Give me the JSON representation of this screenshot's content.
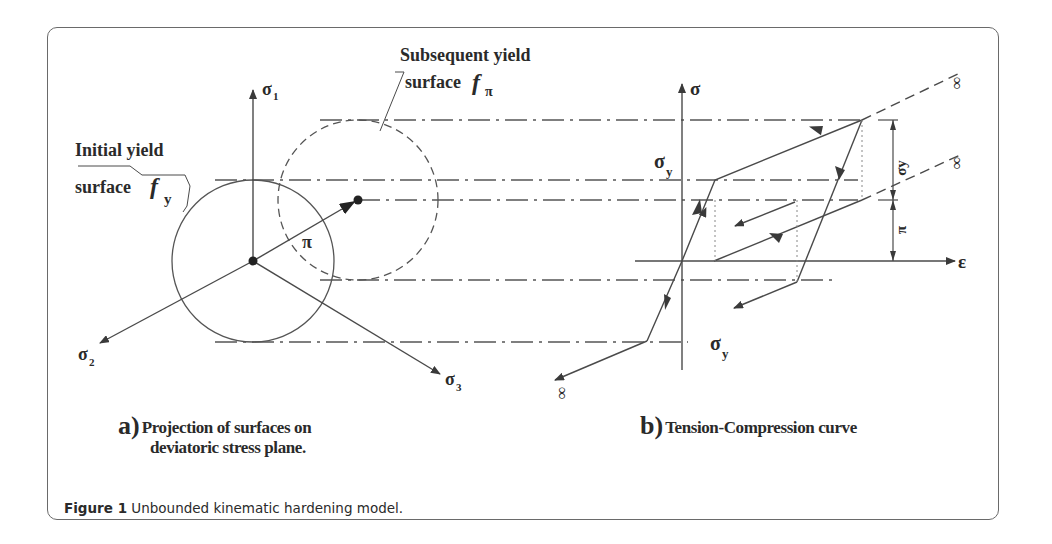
{
  "figure": {
    "caption_label": "Figure 1",
    "caption_text": " Unbounded kinematic hardening model."
  },
  "panel_a": {
    "sublabel": "a)",
    "caption_line1": "Projection of  surfaces on",
    "caption_line2": "deviatoric stress plane.",
    "labels": {
      "initial_line1": "Initial yield",
      "initial_line2": "surface",
      "initial_symbol": "f",
      "initial_subscript": "y",
      "subsequent_line1": "Subsequent yield",
      "subsequent_line2": "surface",
      "subsequent_symbol": "f",
      "subsequent_subscript": "π",
      "axis1": "σ",
      "axis1_sub": "1",
      "axis2": "σ",
      "axis2_sub": "2",
      "axis3": "σ",
      "axis3_sub": "3",
      "backstress": "π"
    }
  },
  "panel_b": {
    "sublabel": "b)",
    "caption_line1": "Tension-Compression curve",
    "labels": {
      "y_axis": "σ",
      "x_axis": "ε",
      "yield_pos": "σ",
      "yield_pos_sub": "y",
      "yield_neg": "σ",
      "yield_neg_sub": "y",
      "dim_upper": "σy",
      "dim_lower": "π",
      "infinity_top": "∞",
      "infinity_mid": "∞",
      "infinity_bottom": "∞"
    }
  },
  "colors": {
    "line": "#4a4a4a",
    "text": "#2a2a2a",
    "frame": "#6a6a6a"
  }
}
